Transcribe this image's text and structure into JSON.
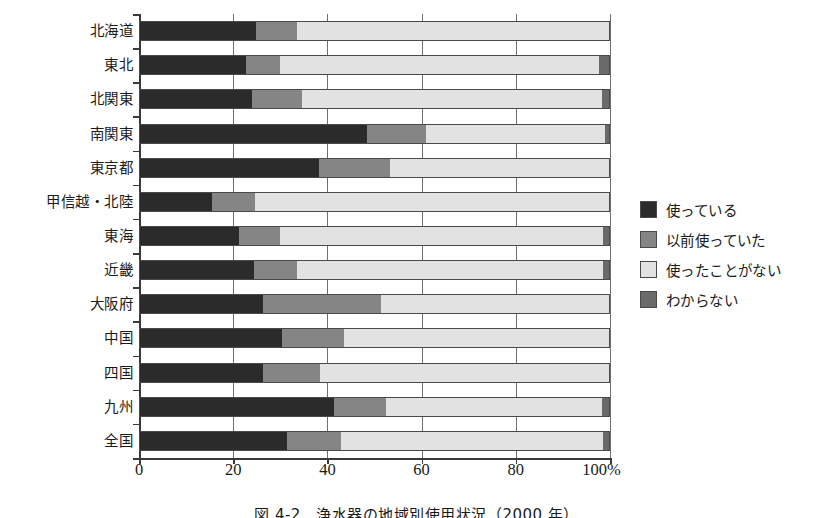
{
  "chart_data": {
    "type": "bar",
    "orientation": "horizontal",
    "stacked": true,
    "stacked_mode": "percent",
    "title": "",
    "caption": "図 4-2　浄水器の地域別使用状況（2000 年）",
    "xlabel": "",
    "ylabel": "",
    "xlim": [
      0,
      100
    ],
    "xticks": [
      0,
      20,
      40,
      60,
      80,
      100
    ],
    "xticklabels": [
      "0",
      "20",
      "40",
      "60",
      "80",
      "100%"
    ],
    "grid": "vertical",
    "legend_position": "right",
    "categories": [
      "北海道",
      "東北",
      "北関東",
      "南関東",
      "東京都",
      "甲信越・北陸",
      "東海",
      "近畿",
      "大阪府",
      "中国",
      "四国",
      "九州",
      "全国"
    ],
    "series": [
      {
        "name": "使っている",
        "color": "#2b2b2b",
        "values": [
          24.8,
          22.7,
          24.0,
          48.4,
          38.2,
          15.5,
          21.2,
          24.4,
          26.3,
          30.4,
          26.3,
          41.4,
          31.5
        ]
      },
      {
        "name": "以前使っていた",
        "color": "#858585",
        "values": [
          8.7,
          7.3,
          10.6,
          12.6,
          15.0,
          9.1,
          8.8,
          9.2,
          25.1,
          13.1,
          12.1,
          11.0,
          11.3
        ]
      },
      {
        "name": "使ったことがない",
        "color": "#e2e2e2",
        "values": [
          66.5,
          67.6,
          63.6,
          38.0,
          46.8,
          75.4,
          68.5,
          64.9,
          48.6,
          56.5,
          61.6,
          46.0,
          55.7
        ]
      },
      {
        "name": "わからない",
        "color": "#6a6a6a",
        "values": [
          0.0,
          2.4,
          1.8,
          1.0,
          0.0,
          0.0,
          1.5,
          1.5,
          0.0,
          0.0,
          0.0,
          1.6,
          1.5
        ]
      }
    ]
  }
}
